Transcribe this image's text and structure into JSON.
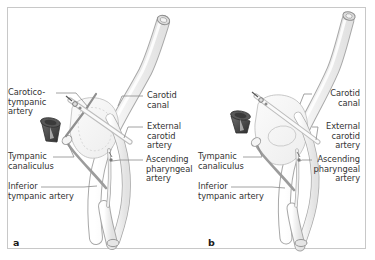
{
  "figure": {
    "type": "anatomical-illustration",
    "background_color": "#ffffff",
    "border_color": "#c8c8c8",
    "vessel_outline_color": "#9a9a9a",
    "vessel_fill_color": "#f2f2f2",
    "bone_outline_color": "#bdbdbd",
    "cone_dark_color": "#4a4a4a",
    "label_text_color": "#333333",
    "leader_line_color": "#808080"
  },
  "panels": [
    {
      "id": "a",
      "letter": "a",
      "labels_left": [
        {
          "id": "caroticotympanic-artery",
          "lines": [
            "Carotico-",
            "tympanic",
            "artery"
          ]
        },
        {
          "id": "tympanic-canaliculus",
          "lines": [
            "Tympanic",
            "canaliculus"
          ]
        },
        {
          "id": "inferior-tympanic-artery",
          "lines": [
            "Inferior",
            "tympanic artery"
          ]
        }
      ],
      "labels_right": [
        {
          "id": "carotid-canal",
          "lines": [
            "Carotid",
            "canal"
          ]
        },
        {
          "id": "external-carotid-artery",
          "lines": [
            "External",
            "carotid",
            "artery"
          ]
        },
        {
          "id": "ascending-pharyngeal-artery",
          "lines": [
            "Ascending",
            "pharyngeal",
            "artery"
          ]
        }
      ]
    },
    {
      "id": "b",
      "letter": "b",
      "labels_left": [
        {
          "id": "tympanic-canaliculus",
          "lines": [
            "Tympanic",
            "canaliculus"
          ]
        },
        {
          "id": "inferior-tympanic-artery",
          "lines": [
            "Inferior",
            "tympanic artery"
          ]
        }
      ],
      "labels_right": [
        {
          "id": "carotid-canal",
          "lines": [
            "Carotid",
            "canal"
          ]
        },
        {
          "id": "external-carotid-artery",
          "lines": [
            "External",
            "carotid",
            "artery"
          ]
        },
        {
          "id": "ascending-pharyngeal-artery",
          "lines": [
            "Ascending",
            "pharyngeal",
            "artery"
          ]
        }
      ]
    }
  ],
  "text": {
    "a": {
      "caroticotympanic_l1": "Carotico-",
      "caroticotympanic_l2": "tympanic",
      "caroticotympanic_l3": "artery",
      "tympanic_canaliculus_l1": "Tympanic",
      "tympanic_canaliculus_l2": "canaliculus",
      "inferior_tympanic_l1": "Inferior",
      "inferior_tympanic_l2": "tympanic artery",
      "carotid_canal_l1": "Carotid",
      "carotid_canal_l2": "canal",
      "external_carotid_l1": "External",
      "external_carotid_l2": "carotid",
      "external_carotid_l3": "artery",
      "ascending_pharyngeal_l1": "Ascending",
      "ascending_pharyngeal_l2": "pharyngeal",
      "ascending_pharyngeal_l3": "artery",
      "letter": "a"
    },
    "b": {
      "tympanic_canaliculus_l1": "Tympanic",
      "tympanic_canaliculus_l2": "canaliculus",
      "inferior_tympanic_l1": "Inferior",
      "inferior_tympanic_l2": "tympanic artery",
      "carotid_canal_l1": "Carotid",
      "carotid_canal_l2": "canal",
      "external_carotid_l1": "External",
      "external_carotid_l2": "carotid",
      "external_carotid_l3": "artery",
      "ascending_pharyngeal_l1": "Ascending",
      "ascending_pharyngeal_l2": "pharyngeal",
      "ascending_pharyngeal_l3": "artery",
      "letter": "b"
    }
  }
}
